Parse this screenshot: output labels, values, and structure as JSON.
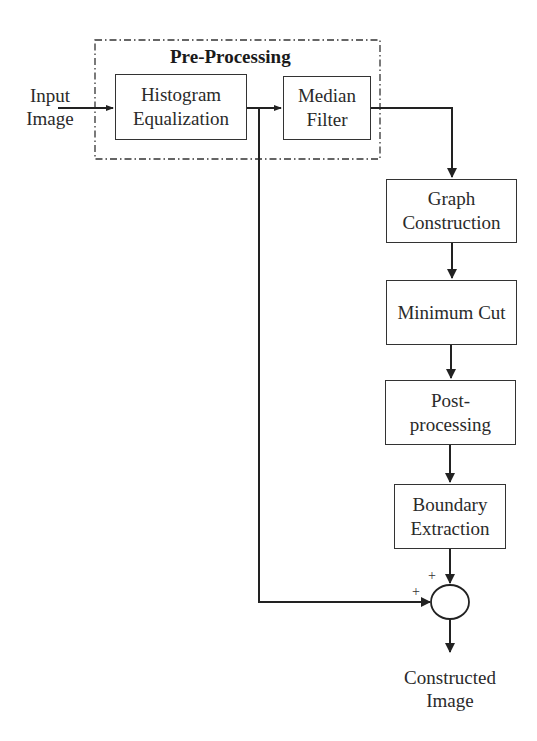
{
  "diagram": {
    "group": {
      "title": "Pre-Processing"
    },
    "input": {
      "line1": "Input",
      "line2": "Image"
    },
    "output": {
      "line1": "Constructed",
      "line2": "Image"
    },
    "blocks": [
      {
        "id": "histogram",
        "line1": "Histogram",
        "line2": "Equalization"
      },
      {
        "id": "median",
        "line1": "Median",
        "line2": "Filter"
      },
      {
        "id": "graph",
        "line1": "Graph",
        "line2": "Construction"
      },
      {
        "id": "mincut",
        "line1": "Minimum Cut",
        "line2": ""
      },
      {
        "id": "post",
        "line1": "Post-",
        "line2": "processing"
      },
      {
        "id": "boundary",
        "line1": "Boundary",
        "line2": "Extraction"
      }
    ],
    "summing_junction": {
      "sign_top": "+",
      "sign_left": "+"
    },
    "colors": {
      "stroke": "#333333",
      "background": "#ffffff"
    }
  }
}
